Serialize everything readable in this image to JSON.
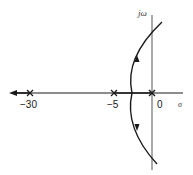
{
  "diagram": {
    "type": "root-locus",
    "axes": {
      "real_axis_label": "σ",
      "imag_axis_label": "jω"
    },
    "poles": [
      {
        "value": -30,
        "label": "−30",
        "marker": "x"
      },
      {
        "value": -5,
        "label": "−5",
        "marker": "x"
      },
      {
        "value": 0,
        "label": "0",
        "marker": "x"
      }
    ],
    "branches": [
      {
        "name": "real-axis-left-branch",
        "description": "From pole at -30 toward -infinity along the negative real axis",
        "direction": "left"
      },
      {
        "name": "real-axis-segment",
        "description": "Segment between poles at -5 and 0"
      },
      {
        "name": "complex-branch-upper",
        "description": "Upper arc leaving the real axis, heading up and crossing the jω axis",
        "direction": "up"
      },
      {
        "name": "complex-branch-lower",
        "description": "Lower arc leaving the real axis, heading down and crossing the jω axis",
        "direction": "down"
      }
    ],
    "colors": {
      "line": "#1a1a1a",
      "background": "#ffffff"
    }
  }
}
